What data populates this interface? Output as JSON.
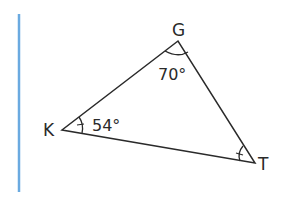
{
  "diagram": {
    "type": "triangle",
    "vertices": [
      {
        "name": "G",
        "x": 178,
        "y": 41
      },
      {
        "name": "K",
        "x": 62,
        "y": 130
      },
      {
        "name": "T",
        "x": 255,
        "y": 163
      }
    ],
    "angles": {
      "G": "70°",
      "K": "54°",
      "T": ""
    },
    "labels": {
      "G": "G",
      "K": "K",
      "T": "T"
    },
    "colors": {
      "stroke": "#2a2a2a",
      "margin_bar": "#6aaae0"
    }
  }
}
